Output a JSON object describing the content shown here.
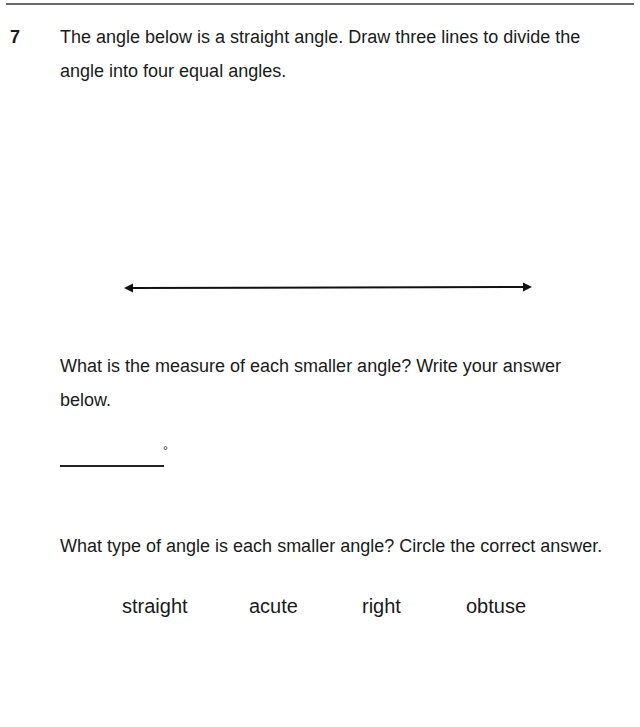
{
  "question": {
    "number": "7",
    "prompt_line1": "The angle below is a straight angle. Draw three lines to divide the",
    "prompt_line2": "angle into four equal angles.",
    "figure": {
      "type": "straight-angle-line",
      "arrowheads": "both-ends"
    },
    "part_a": {
      "line1": "What is the measure of each smaller angle? Write your answer",
      "line2": "below.",
      "answer_value": "",
      "unit_symbol": "°"
    },
    "part_b": {
      "prompt": "What type of angle is each smaller angle? Circle the correct answer.",
      "choices": [
        "straight",
        "acute",
        "right",
        "obtuse"
      ]
    }
  }
}
